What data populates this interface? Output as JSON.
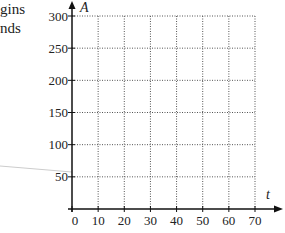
{
  "clipped_text": {
    "line1": "gins",
    "line2": "nds"
  },
  "chart_data": {
    "type": "line",
    "title": "",
    "xlabel": "t",
    "ylabel": "A",
    "x_ticks": [
      0,
      10,
      20,
      30,
      40,
      50,
      60,
      70
    ],
    "y_ticks": [
      50,
      100,
      150,
      200,
      250,
      300
    ],
    "xlim": [
      0,
      70
    ],
    "ylim": [
      0,
      300
    ],
    "grid": true,
    "grid_style": "dotted",
    "series": [],
    "legend": null
  },
  "colors": {
    "axis": "#111111",
    "grid": "#555555",
    "stray_line": "#cccccc"
  }
}
